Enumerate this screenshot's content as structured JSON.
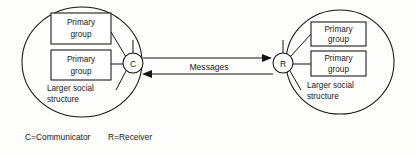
{
  "figure": {
    "background_color": "#fdfdfc",
    "line_color": "#141414",
    "text_color": "#1a1a1a"
  },
  "left_cluster": {
    "name": "communicator-cluster",
    "node_label": "C",
    "social_structure_label_line1": "Larger social",
    "social_structure_label_line2": "structure",
    "groups": [
      {
        "line1": "Primary",
        "line2": "group"
      },
      {
        "line1": "Primary",
        "line2": "group"
      }
    ]
  },
  "right_cluster": {
    "name": "receiver-cluster",
    "node_label": "R",
    "social_structure_label_line1": "Larger social",
    "social_structure_label_line2": "structure",
    "groups": [
      {
        "line1": "Primary",
        "line2": "group"
      },
      {
        "line1": "Primary",
        "line2": "group"
      }
    ]
  },
  "channel": {
    "label": "Messages",
    "direction": "bidirectional"
  },
  "legend": {
    "items": [
      {
        "key": "C",
        "separator": "=",
        "value": "Communicator",
        "full": "C=Communicator"
      },
      {
        "key": "R",
        "separator": "=",
        "value": "Receiver",
        "full": "R=Receiver"
      }
    ]
  }
}
